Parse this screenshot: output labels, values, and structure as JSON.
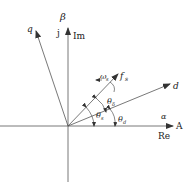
{
  "diagram": {
    "type": "vector-phasor-diagram",
    "axes": {
      "horizontal": {
        "greek": "α",
        "tip": "A",
        "complex": "Re"
      },
      "vertical": {
        "greek": "β",
        "imag_unit": "j",
        "complex": "Im"
      }
    },
    "vectors": [
      {
        "id": "q",
        "label": "q"
      },
      {
        "id": "fs",
        "label": "f",
        "subscript": "s"
      },
      {
        "id": "d",
        "label": "d"
      }
    ],
    "rotation": {
      "label": "ω",
      "subscript": "s"
    },
    "angles": [
      {
        "id": "theta_s",
        "label": "θ",
        "subscript": "s"
      },
      {
        "id": "theta_delta",
        "label": "θ",
        "subscript": "δ"
      },
      {
        "id": "theta_d",
        "label": "θ",
        "subscript": "d"
      }
    ],
    "colors": {
      "line": "#333333",
      "text": "#222222",
      "background": "#ffffff"
    }
  }
}
